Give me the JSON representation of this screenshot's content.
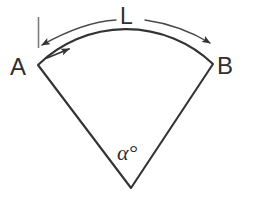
{
  "figure": {
    "type": "geometry-diagram",
    "background_color": "#ffffff",
    "stroke_color": "#333333",
    "thin_stroke_color": "#4a4a4a",
    "tick_color": "#7d7d7d",
    "labels": {
      "point_a": "A",
      "point_b": "B",
      "arc_length": "L",
      "central_angle": "α°"
    },
    "geometry": {
      "apex": {
        "x": 131,
        "y": 188
      },
      "point_a": {
        "x": 38,
        "y": 65
      },
      "point_b": {
        "x": 213,
        "y": 64
      },
      "arc_apex": {
        "x": 130,
        "y": 42
      },
      "dimension_arc_left": {
        "x": 42,
        "y": 45
      },
      "dimension_arc_right": {
        "x": 210,
        "y": 43
      },
      "dimension_arc_apex": {
        "x": 130,
        "y": 22
      },
      "extension_tick": {
        "x": 38,
        "y_top": 17,
        "y_bottom": 48
      },
      "direction_arrow_on_arc": {
        "x": 63,
        "y": 52
      }
    }
  }
}
